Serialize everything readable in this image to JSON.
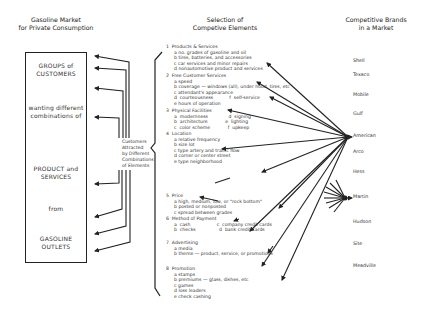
{
  "headers": {
    "left": [
      "Gasoline Market",
      "for Private Consumption"
    ],
    "middle": [
      "Selection of",
      "Competive Elements"
    ],
    "right": [
      "Competitive Brands",
      "in a Market"
    ]
  },
  "box": {
    "groups": [
      "GROUPS of",
      "CUSTOMERS"
    ],
    "wanting": [
      "wanting different",
      "combinations of"
    ],
    "product": [
      "PRODUCT and",
      "SERVICES"
    ],
    "from": "from",
    "outlets": [
      "GASOLINE",
      "OUTLETS"
    ]
  },
  "attracted": [
    "Customers",
    "Attracted",
    "by Different",
    "Combinations",
    "of Elements"
  ],
  "elements": [
    {
      "num": "1",
      "title": "Products & Services",
      "items": [
        "a  no. grades of gasoline and oil",
        "b  tires, batteries, and accessories",
        "c  car services and minor repairs",
        "d  nonautomotive product and services"
      ]
    },
    {
      "num": "2",
      "title": "Free Customer Services",
      "items": [
        "a  speed",
        "b  coverage — windows (all), under hood, tires, etc",
        "c  attendant's appearance",
        "d  courteousness           f  self-service",
        "e  hours of operation"
      ]
    },
    {
      "num": "3",
      "title": "Physical Facilities",
      "items": [
        "a  modernness              d  signing",
        "b  architecture            e  lighting",
        "c  color scheme            f  upkeep"
      ]
    },
    {
      "num": "4",
      "title": "Location",
      "items": [
        "a  relative frequency",
        "b  size lot",
        "c  type artery and traffic flow",
        "d  corner or center street",
        "e  type neighborhood"
      ]
    },
    {
      "num": "5",
      "title": "Price",
      "items": [
        "a  high, medium, low, or \"rock bottom\"",
        "b  posted or nonposted",
        "c  spread between grades"
      ]
    },
    {
      "num": "6",
      "title": "Method of Payment",
      "items": [
        "a  cash                  c  company credit cards",
        "b  checks                d  bank credit cards"
      ]
    },
    {
      "num": "7",
      "title": "Advertising",
      "items": [
        "a  media",
        "b  theme — product, service, or promotions"
      ]
    },
    {
      "num": "8",
      "title": "Promotion",
      "items": [
        "a  stamps",
        "b  premiums — glass, dishes, etc",
        "c  games",
        "d  loss leaders",
        "e  check cashing"
      ]
    }
  ],
  "brands": [
    "Shell",
    "Texaco",
    "Mobile",
    "Gulf",
    "American",
    "Arco",
    "Hess",
    "Martin",
    "Hudson",
    "Site",
    "Meadville"
  ]
}
